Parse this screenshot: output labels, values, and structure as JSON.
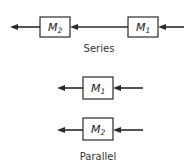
{
  "series": {
    "caption": "Series",
    "blocks": [
      {
        "name": "M",
        "sub": "2"
      },
      {
        "name": "M",
        "sub": "1"
      }
    ],
    "flow_direction": "right-to-left"
  },
  "parallel": {
    "caption": "Parallel",
    "blocks": [
      {
        "name": "M",
        "sub": "1"
      },
      {
        "name": "M",
        "sub": "2"
      }
    ],
    "flow_direction": "right-to-left"
  },
  "colors": {
    "stroke": "#2a2a2a",
    "text": "#1a1a1a",
    "background": "#ffffff"
  }
}
